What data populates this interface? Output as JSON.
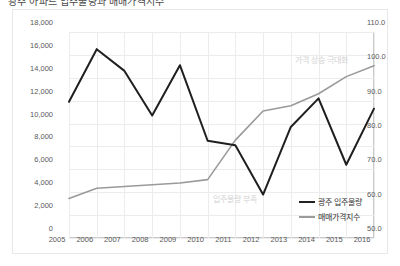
{
  "title": "광주 아파트 입주물량과 매매가격지수",
  "chart_data": {
    "type": "line",
    "title": "광주 아파트 입주물량과 매매가격지수",
    "xlabel": "",
    "ylabel": "",
    "x": [
      "2005",
      "2006",
      "2007",
      "2008",
      "2009",
      "2010",
      "2011",
      "2012",
      "2013",
      "2014",
      "2015",
      "2016"
    ],
    "series": [
      {
        "name": "광주 입주물량",
        "axis": "left",
        "color": "#1f1f1f",
        "values": [
          11900,
          16500,
          14600,
          10700,
          15100,
          8500,
          8100,
          3800,
          9700,
          12200,
          6400,
          11300
        ]
      },
      {
        "name": "매매가격지수",
        "axis": "right",
        "color": "#9a9a9a",
        "values": [
          61.5,
          64.5,
          65.0,
          65.5,
          66.0,
          67.0,
          78.5,
          87.0,
          88.5,
          92.0,
          97.0,
          100.2
        ]
      }
    ],
    "left_axis": {
      "label": "",
      "ticks": [
        "0",
        "2,000",
        "4,000",
        "6,000",
        "8,000",
        "10,000",
        "12,000",
        "14,000",
        "16,000",
        "18,000"
      ],
      "min": 0,
      "max": 18000,
      "step": 2000
    },
    "right_axis": {
      "label": "",
      "ticks": [
        "50.0",
        "60.0",
        "70.0",
        "80.0",
        "90.0",
        "100.0",
        "110.0"
      ],
      "min": 50,
      "max": 110,
      "step": 10
    },
    "grid": true,
    "legend_position": "bottom-right",
    "legend": [
      "광주 입주물량",
      "매매가격지수"
    ],
    "annotations": [
      {
        "text": "가격 상승 극대화",
        "near": "2015"
      },
      {
        "text": "입주물량 부족",
        "near": "2012"
      }
    ]
  },
  "colors": {
    "supply_line": "#1f1f1f",
    "price_line": "#9a9a9a",
    "grid": "#ececec",
    "axis": "#c9c9c9",
    "annotation": "#d2d2d2"
  }
}
